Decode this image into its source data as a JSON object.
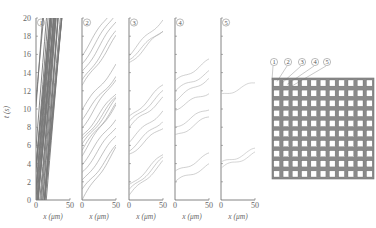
{
  "chart_data": {
    "type": "line",
    "title": "",
    "ylabel": "t (s)",
    "xlabel": "x (μm)",
    "ylim": [
      0,
      20
    ],
    "xlim": [
      0,
      50
    ],
    "yticks": [
      "0",
      "2",
      "4",
      "6",
      "8",
      "10",
      "12",
      "14",
      "16",
      "18",
      "20"
    ],
    "xticks": [
      "0",
      "50"
    ],
    "panels": [
      {
        "label": "①",
        "xlabel": "x (μm)",
        "density": "very high",
        "trajectories": 30
      },
      {
        "label": "②",
        "xlabel": "x (μm)",
        "density": "high",
        "trajectories": 18
      },
      {
        "label": "③",
        "xlabel": "x (μm)",
        "density": "medium",
        "trajectories": 12
      },
      {
        "label": "④",
        "xlabel": "x (μm)",
        "density": "low",
        "trajectories": 8
      },
      {
        "label": "⑤",
        "xlabel": "x (μm)",
        "density": "very low",
        "trajectories": 3
      }
    ],
    "inset": {
      "type": "lattice-diagram",
      "labels": [
        "①",
        "②",
        "③",
        "④",
        "⑤"
      ],
      "grid": "11x10 square obstacles"
    }
  },
  "axis": {
    "ylabel": "t (s)",
    "xlabel": "x (μm)"
  }
}
